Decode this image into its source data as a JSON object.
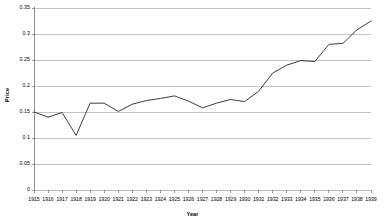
{
  "chart_data": {
    "type": "line",
    "title": "",
    "xlabel": "Year",
    "ylabel": "Price",
    "grid": true,
    "legend": "none",
    "xlim": [
      1915,
      1939
    ],
    "ylim": [
      0,
      0.35
    ],
    "ytick_labels": [
      "0",
      "0.05",
      "0.1",
      "0.15",
      "0.2",
      "0.25",
      "0.3",
      "0.35"
    ],
    "ytick_values": [
      0,
      0.05,
      0.1,
      0.15,
      0.2,
      0.25,
      0.3,
      0.35
    ],
    "categories": [
      "1915",
      "1916",
      "1917",
      "1918",
      "1919",
      "1920",
      "1921",
      "1922",
      "1923",
      "1924",
      "1925",
      "1926",
      "1927",
      "1928",
      "1929",
      "1930",
      "1931",
      "1932",
      "1933",
      "1934",
      "1935",
      "1936",
      "1937",
      "1938",
      "1939"
    ],
    "x": [
      1915,
      1916,
      1917,
      1918,
      1919,
      1920,
      1921,
      1922,
      1923,
      1924,
      1925,
      1926,
      1927,
      1928,
      1929,
      1930,
      1931,
      1932,
      1933,
      1934,
      1935,
      1936,
      1937,
      1938,
      1939
    ],
    "series": [
      {
        "name": "Price",
        "color": "#3d3d3d",
        "values": [
          0.15,
          0.14,
          0.149,
          0.105,
          0.167,
          0.167,
          0.151,
          0.165,
          0.172,
          0.176,
          0.181,
          0.171,
          0.158,
          0.167,
          0.174,
          0.17,
          0.19,
          0.225,
          0.24,
          0.249,
          0.247,
          0.28,
          0.282,
          0.308,
          0.325
        ]
      }
    ]
  },
  "axes": {
    "x_title": "Year",
    "y_title": "Price"
  },
  "colors": {
    "line": "#3d3d3d",
    "grid": "#b5b5b5",
    "axis": "#808080",
    "background": "#ffffff"
  }
}
